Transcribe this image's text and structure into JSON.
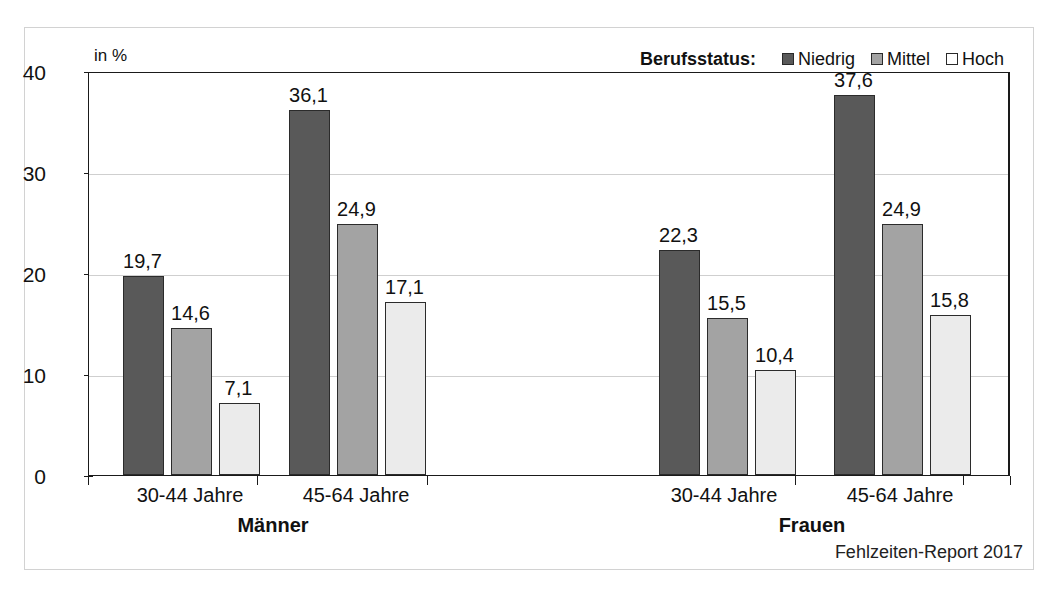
{
  "chart_data": {
    "type": "bar",
    "title": "",
    "xlabel": "",
    "ylabel": "in %",
    "unit_label": "in %",
    "ylim": [
      0,
      40
    ],
    "yticks": [
      0,
      10,
      20,
      30,
      40
    ],
    "ytick_labels": [
      "0",
      "10",
      "20",
      "30",
      "40"
    ],
    "grid": true,
    "gridlines_at": [
      10,
      20,
      30
    ],
    "legend_position": "top-right",
    "legend_title": "Berufsstatus:",
    "categories": [
      "30-44 Jahre",
      "45-64 Jahre",
      "30-44 Jahre",
      "45-64 Jahre"
    ],
    "super_categories": [
      "Männer",
      "Frauen"
    ],
    "series": [
      {
        "name": "Niedrig",
        "color": "#595959",
        "values": [
          19.7,
          36.1,
          22.3,
          37.6
        ]
      },
      {
        "name": "Mittel",
        "color": "#a3a3a3",
        "values": [
          14.6,
          24.9,
          15.5,
          24.9
        ]
      },
      {
        "name": "Hoch",
        "color": "#ebebeb",
        "values": [
          7.1,
          17.1,
          10.4,
          15.8
        ]
      }
    ],
    "value_labels": [
      [
        "19,7",
        "14,6",
        "7,1"
      ],
      [
        "36,1",
        "24,9",
        "17,1"
      ],
      [
        "22,3",
        "15,5",
        "10,4"
      ],
      [
        "37,6",
        "24,9",
        "15,8"
      ]
    ],
    "source_note": "Fehlzeiten-Report 2017"
  },
  "colors": {
    "niedrig": "#595959",
    "mittel": "#a3a3a3",
    "hoch": "#ebebeb",
    "axis": "#1a1a1a",
    "grid": "#cfcfcf",
    "text": "#111111"
  }
}
